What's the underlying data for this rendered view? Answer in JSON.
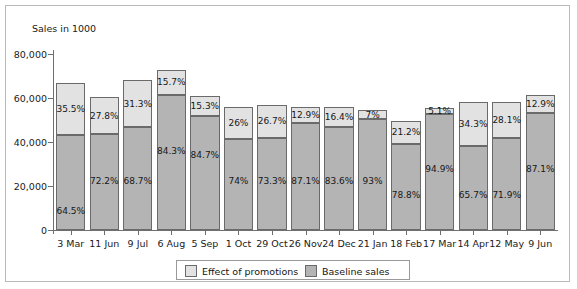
{
  "chart_data": {
    "type": "bar",
    "subtype": "stacked-bar",
    "title": "",
    "xlabel": "",
    "ylabel": "Sales in 1000",
    "ylim": [
      0,
      80000
    ],
    "ytick_labels": [
      "0",
      "20,000",
      "40,000",
      "60,000",
      "80,000"
    ],
    "ytick_values": [
      0,
      20000,
      40000,
      60000,
      80000
    ],
    "grid": false,
    "legend_position": "bottom",
    "categories": [
      "3 Mar",
      "11 Jun",
      "9 Jul",
      "6 Aug",
      "5 Sep",
      "1 Oct",
      "29 Oct",
      "26 Nov",
      "24 Dec",
      "21 Jan",
      "18 Feb",
      "17 Mar",
      "14 Apr",
      "12 May",
      "9 Jun"
    ],
    "series": [
      {
        "name": "Baseline sales",
        "color": "#b4b4b4",
        "values": [
          43000,
          43600,
          46800,
          61400,
          51600,
          41400,
          41800,
          48800,
          46900,
          50500,
          39100,
          52700,
          38300,
          42000,
          53400
        ],
        "labels": [
          "64.5%",
          "72.2%",
          "68.7%",
          "84.3%",
          "84.7%",
          "74%",
          "73.3%",
          "87.1%",
          "83.6%",
          "93%",
          "78.8%",
          "94.9%",
          "65.7%",
          "71.9%",
          "87.1%"
        ]
      },
      {
        "name": "Effect of promotions",
        "color": "#e2e2e2",
        "values": [
          23700,
          16800,
          21300,
          11400,
          9300,
          14600,
          15200,
          7200,
          9200,
          3900,
          10500,
          2800,
          20000,
          16400,
          7900
        ],
        "labels": [
          "35.5%",
          "27.8%",
          "31.3%",
          "15.7%",
          "15.3%",
          "26%",
          "26.7%",
          "12.9%",
          "16.4%",
          "7%",
          "21.2%",
          "5.1%",
          "34.3%",
          "28.1%",
          "12.9%"
        ]
      }
    ],
    "totals": [
      66700,
      60400,
      68100,
      72800,
      60900,
      56000,
      57000,
      56000,
      56100,
      54400,
      49600,
      55500,
      58300,
      58400,
      61300
    ]
  },
  "legend": {
    "items": [
      {
        "label": "Effect of promotions",
        "color": "#e2e2e2"
      },
      {
        "label": "Baseline sales",
        "color": "#b4b4b4"
      }
    ]
  }
}
